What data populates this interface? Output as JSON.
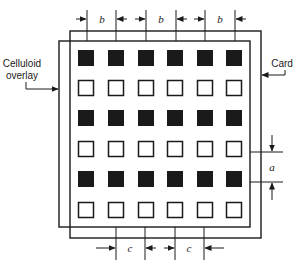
{
  "diagram": {
    "labels": {
      "celluloid_line1": "Celluloid",
      "celluloid_line2": "overlay",
      "card": "Card"
    },
    "dimensions": {
      "top": [
        "b",
        "b",
        "b"
      ],
      "bottom": [
        "c",
        "c"
      ],
      "right": "a"
    },
    "grid": {
      "rows": 6,
      "cols": 6,
      "row_fill": [
        "filled",
        "hollow",
        "filled",
        "hollow",
        "filled",
        "hollow"
      ]
    },
    "colors": {
      "ink": "#1a1a1a",
      "background": "#ffffff"
    }
  }
}
